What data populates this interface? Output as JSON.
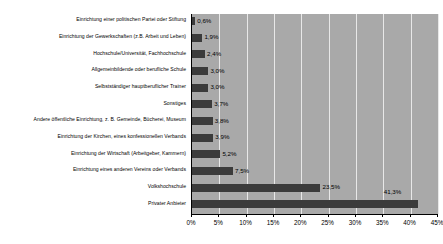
{
  "chart_data": {
    "type": "bar",
    "orientation": "horizontal",
    "title": "",
    "xlabel": "",
    "ylabel": "",
    "xlim": [
      0,
      45
    ],
    "grid": true,
    "legend": "none",
    "categories": [
      "Einrichtung einer politischen Partei oder Stiftung",
      "Einrichtung der Gewerkschaften (z.B. Arbeit und Leben)",
      "Hochschule/Universität, Fachhochschule",
      "Allgemeinbildende oder berufliche Schule",
      "Selbstständiger hauptberuflicher Trainer",
      "Sonstiges",
      "Andere öffentliche Einrichtung, z. B. Gemeinde, Bücherei, Museum",
      "Einrichtung der Kirchen, eines konfessionellen Verbands",
      "Einrichtung der Wirtschaft (Arbeitgeber, Kammern)",
      "Einrichtung eines anderen Vereins oder Verbands",
      "Volkshochschule",
      "Privater Anbieter"
    ],
    "values": [
      0.6,
      1.9,
      2.4,
      3.0,
      3.0,
      3.7,
      3.8,
      3.9,
      5.2,
      7.5,
      23.5,
      41.3
    ],
    "value_labels": [
      "0,6%",
      "1,9%",
      "2,4%",
      "3,0%",
      "3,0%",
      "3,7%",
      "3,8%",
      "3,9%",
      "5,2%",
      "7,5%",
      "23,5%",
      "41,3%"
    ],
    "xticks": [
      0,
      5,
      10,
      15,
      20,
      25,
      30,
      35,
      40,
      45
    ],
    "xtick_labels": [
      "0%",
      "5%",
      "10%",
      "15%",
      "20%",
      "25%",
      "30%",
      "35%",
      "40%",
      "45%"
    ],
    "colors": {
      "bar": "#3b3b3b",
      "plot_background": "#a9a9a9",
      "gridline": "#e8e8e8",
      "axis": "#000000",
      "text": "#000000",
      "page_background": "#ffffff"
    }
  }
}
